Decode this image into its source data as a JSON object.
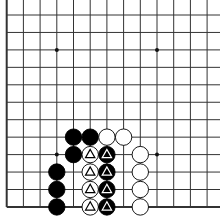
{
  "board": {
    "description": "Go board corner view (lower-left), 13 columns x 12 rows visible",
    "background": "#ffffff",
    "line_color": "#333333",
    "origin_x": 6.7,
    "origin_y": 15,
    "spacing_x": 16.7,
    "spacing_y": 17.45,
    "cols_visible": 13,
    "rows_visible": 12,
    "left_edge": true,
    "bottom_edge": true,
    "star_points": [
      {
        "col": 3,
        "row": 2
      },
      {
        "col": 9,
        "row": 2
      },
      {
        "col": 3,
        "row": 8
      },
      {
        "col": 9,
        "row": 8
      }
    ],
    "stones": [
      {
        "col": 4,
        "row": 7,
        "color": "black",
        "mark": ""
      },
      {
        "col": 5,
        "row": 7,
        "color": "black",
        "mark": ""
      },
      {
        "col": 6,
        "row": 7,
        "color": "white",
        "mark": ""
      },
      {
        "col": 7,
        "row": 7,
        "color": "white",
        "mark": ""
      },
      {
        "col": 4,
        "row": 8,
        "color": "black",
        "mark": ""
      },
      {
        "col": 5,
        "row": 8,
        "color": "white",
        "mark": "triangle"
      },
      {
        "col": 6,
        "row": 8,
        "color": "black",
        "mark": "triangle"
      },
      {
        "col": 8,
        "row": 8,
        "color": "white",
        "mark": ""
      },
      {
        "col": 3,
        "row": 9,
        "color": "black",
        "mark": ""
      },
      {
        "col": 5,
        "row": 9,
        "color": "white",
        "mark": "triangle"
      },
      {
        "col": 6,
        "row": 9,
        "color": "black",
        "mark": "triangle"
      },
      {
        "col": 8,
        "row": 9,
        "color": "white",
        "mark": ""
      },
      {
        "col": 3,
        "row": 10,
        "color": "black",
        "mark": ""
      },
      {
        "col": 5,
        "row": 10,
        "color": "white",
        "mark": "triangle"
      },
      {
        "col": 6,
        "row": 10,
        "color": "black",
        "mark": "triangle"
      },
      {
        "col": 8,
        "row": 10,
        "color": "white",
        "mark": ""
      },
      {
        "col": 3,
        "row": 11,
        "color": "black",
        "mark": ""
      },
      {
        "col": 5,
        "row": 11,
        "color": "white",
        "mark": "triangle"
      },
      {
        "col": 6,
        "row": 11,
        "color": "black",
        "mark": "triangle"
      },
      {
        "col": 8,
        "row": 11,
        "color": "white",
        "mark": ""
      }
    ]
  }
}
